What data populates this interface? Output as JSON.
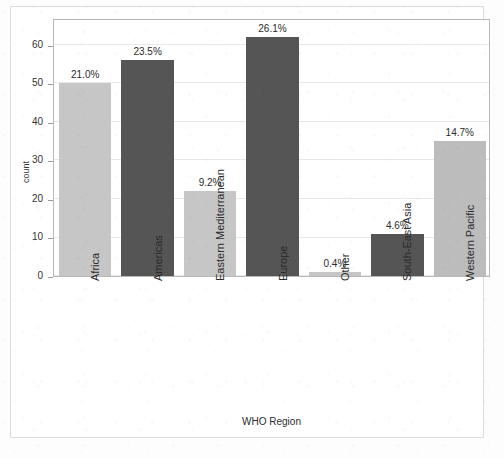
{
  "chart_data": {
    "type": "bar",
    "title": "",
    "xlabel": "WHO Region",
    "ylabel": "count",
    "categories": [
      "Africa",
      "Americas",
      "Eastern Mediterranean",
      "Europe",
      "Other",
      "South-East Asia",
      "Western Pacific"
    ],
    "values": [
      50,
      56,
      22,
      62,
      1,
      11,
      35
    ],
    "data_labels": [
      "21.0%",
      "23.5%",
      "9.2%",
      "26.1%",
      "0.4%",
      "4.6%",
      "14.7%"
    ],
    "percentages": [
      21.0,
      23.5,
      9.2,
      26.1,
      0.4,
      4.6,
      14.7
    ],
    "bar_colors": [
      "#c6c6c6",
      "#555555",
      "#c6c6c6",
      "#555555",
      "#c6c6c6",
      "#555555",
      "#bcbcbc"
    ],
    "ylim": [
      0,
      67
    ],
    "yticks": [
      0,
      10,
      20,
      30,
      40,
      50,
      60
    ],
    "ytick_labels": [
      "0",
      "10",
      "20",
      "30",
      "40",
      "50",
      "60"
    ],
    "grid": true,
    "grid_axis": "y",
    "legend": false,
    "xtick_rotation": 90,
    "palette": {
      "light_bar": "#c6c6c6",
      "dark_bar": "#555555",
      "gridline": "#e8e8e8",
      "axis_border": "#b9b9b9",
      "text": "#2b2b2b",
      "background": "#ffffff"
    }
  }
}
